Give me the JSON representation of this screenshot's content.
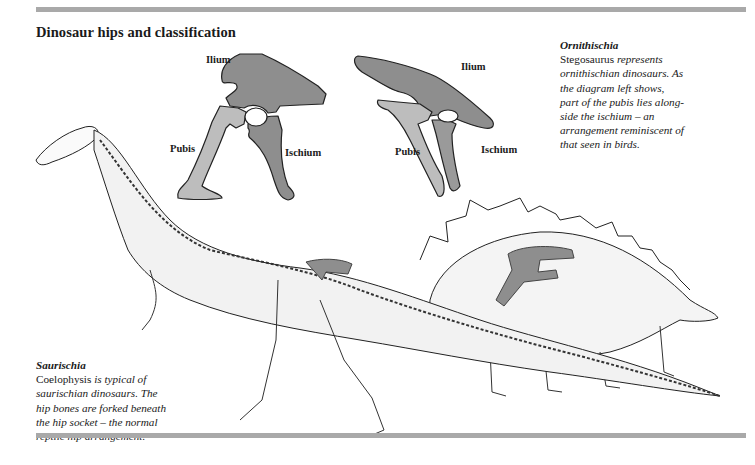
{
  "page": {
    "title": "Dinosaur hips and classification"
  },
  "hip_diagrams": {
    "saurischian": {
      "labels": {
        "ilium": "Ilium",
        "pubis": "Pubis",
        "ischium": "Ischium"
      }
    },
    "ornithischian": {
      "labels": {
        "ilium": "Ilium",
        "pubis": "Pubis",
        "ischium": "Ischium"
      }
    }
  },
  "captions": {
    "ornithischia": {
      "heading": "Ornithischia",
      "subject": "Stegosaurus",
      "lines": [
        "represents",
        "ornithischian dinosaurs. As",
        "the diagram left shows,",
        "part of the pubis lies along-",
        "side the ischium – an",
        "arrangement reminiscent of",
        "that seen in birds."
      ]
    },
    "saurischia": {
      "heading": "Saurischia",
      "subject": "Coelophysis",
      "lines": [
        "is typical of",
        "saurischian dinosaurs. The",
        "hip bones are forked beneath",
        "the hip socket –  the normal",
        "reptile hip arrangement."
      ]
    }
  },
  "illustrations": {
    "dinosaurs": [
      "Coelophysis skeleton",
      "Stegosaurus skeleton"
    ]
  },
  "colors": {
    "rule": "#a9a9a9",
    "ilium_ischium_dark": "#8e8e8e",
    "pubis_light": "#bdbdbd",
    "ink": "#1a1a1a"
  }
}
